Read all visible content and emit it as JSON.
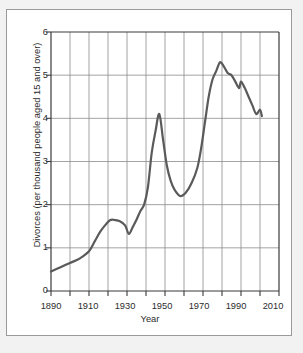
{
  "figure": {
    "background": "#ffffff",
    "page_background": "#f2f2f2",
    "border_color": "#9a9a9a"
  },
  "chart_data": {
    "type": "line",
    "title": "",
    "xlabel": "Year",
    "ylabel": "Divorces (per thousand people aged 15 and over)",
    "xlim": [
      1890,
      2010
    ],
    "ylim": [
      0,
      6
    ],
    "xticks": [
      1890,
      1900,
      1910,
      1920,
      1930,
      1940,
      1950,
      1960,
      1970,
      1980,
      1990,
      2000,
      2010
    ],
    "xtick_labels": [
      "1890",
      "",
      "1910",
      "",
      "1930",
      "",
      "1950",
      "",
      "1970",
      "",
      "1990",
      "",
      "2010"
    ],
    "xtick_labels_major": [
      "1890",
      "1910",
      "1930",
      "1950",
      "1970",
      "1990",
      "2010"
    ],
    "yticks": [
      0,
      1,
      2,
      3,
      4,
      5,
      6
    ],
    "ytick_labels": [
      "0",
      "1",
      "2",
      "3",
      "4",
      "5",
      "6"
    ],
    "grid": true,
    "grid_x": true,
    "grid_y": true,
    "legend": null,
    "line_color": "#5a5a5a",
    "line_width": 2.2,
    "x": [
      1890,
      1895,
      1900,
      1905,
      1910,
      1913,
      1916,
      1919,
      1921,
      1923,
      1926,
      1929,
      1931,
      1933,
      1935,
      1937,
      1939,
      1941,
      1943,
      1945,
      1947,
      1949,
      1951,
      1953,
      1955,
      1958,
      1961,
      1964,
      1967,
      1969,
      1971,
      1973,
      1975,
      1977,
      1979,
      1981,
      1983,
      1985,
      1987,
      1989,
      1990,
      1992,
      1994,
      1996,
      1998,
      2000,
      2001
    ],
    "y": [
      0.45,
      0.55,
      0.65,
      0.75,
      0.92,
      1.15,
      1.38,
      1.55,
      1.64,
      1.65,
      1.62,
      1.52,
      1.32,
      1.48,
      1.65,
      1.85,
      2.0,
      2.4,
      3.2,
      3.7,
      4.1,
      3.5,
      2.9,
      2.55,
      2.35,
      2.2,
      2.28,
      2.5,
      2.85,
      3.3,
      3.9,
      4.5,
      4.9,
      5.1,
      5.3,
      5.2,
      5.05,
      5.0,
      4.85,
      4.7,
      4.85,
      4.7,
      4.5,
      4.3,
      4.1,
      4.2,
      4.05
    ],
    "series_name": "US divorce rate"
  }
}
